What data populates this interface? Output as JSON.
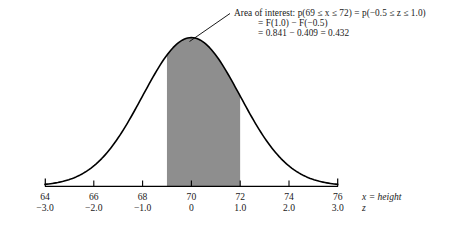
{
  "figure": {
    "annotation": {
      "line1": "Area of interest:  p(69 ≤ x ≤ 72) = p(−0.5 ≤ z ≤ 1.0)",
      "line2": "= F(1.0) − F(−0.5)",
      "line3": "= 0.841 − 0.409 = 0.432"
    },
    "axis_names": {
      "x_label": "x = height",
      "z_label": "z"
    },
    "colors": {
      "curve": "#000000",
      "shade_fill": "#8e8e8e",
      "axis": "#000000",
      "background": "#ffffff",
      "text": "#1a1a1a"
    }
  },
  "chart_data": {
    "type": "area",
    "title": "",
    "subtitle": "",
    "xlabel": "x = height",
    "ylabel": "",
    "secondary_xlabel": "z",
    "grid": false,
    "legend": null,
    "distribution": {
      "name": "normal",
      "mean_x": 70,
      "sd_x": 2,
      "mean_z": 0,
      "sd_z": 1
    },
    "xlim": [
      64,
      76
    ],
    "zlim": [
      -3.0,
      3.0
    ],
    "ylim": [
      0,
      1
    ],
    "x_ticks": [
      64,
      66,
      68,
      70,
      72,
      74,
      76
    ],
    "x_ticklabels": [
      "64",
      "66",
      "68",
      "70",
      "72",
      "74",
      "76"
    ],
    "z_ticks": [
      -3.0,
      -2.0,
      -1.0,
      0,
      1.0,
      2.0,
      3.0
    ],
    "z_ticklabels": [
      "−3.0",
      "−2.0",
      "−1.0",
      "0",
      "1.0",
      "2.0",
      "3.0"
    ],
    "shaded_region": {
      "x_from": 69,
      "x_to": 72,
      "z_from": -0.5,
      "z_to": 1.0,
      "area": 0.432,
      "fill": "#8e8e8e"
    },
    "annotations": [
      {
        "text": "Area of interest:  p(69 ≤ x ≤ 72) = p(−0.5 ≤ z ≤ 1.0)",
        "line": 1
      },
      {
        "text": "= F(1.0) − F(−0.5)",
        "line": 2
      },
      {
        "text": "= 0.841 − 0.409 = 0.432",
        "line": 3
      }
    ],
    "cdf_values": {
      "F_at_1.0": 0.841,
      "F_at_-0.5": 0.409,
      "difference": 0.432
    },
    "leader_line": {
      "from_x": 190,
      "from_y": 41,
      "to_x": 229,
      "to_y": 14
    }
  }
}
